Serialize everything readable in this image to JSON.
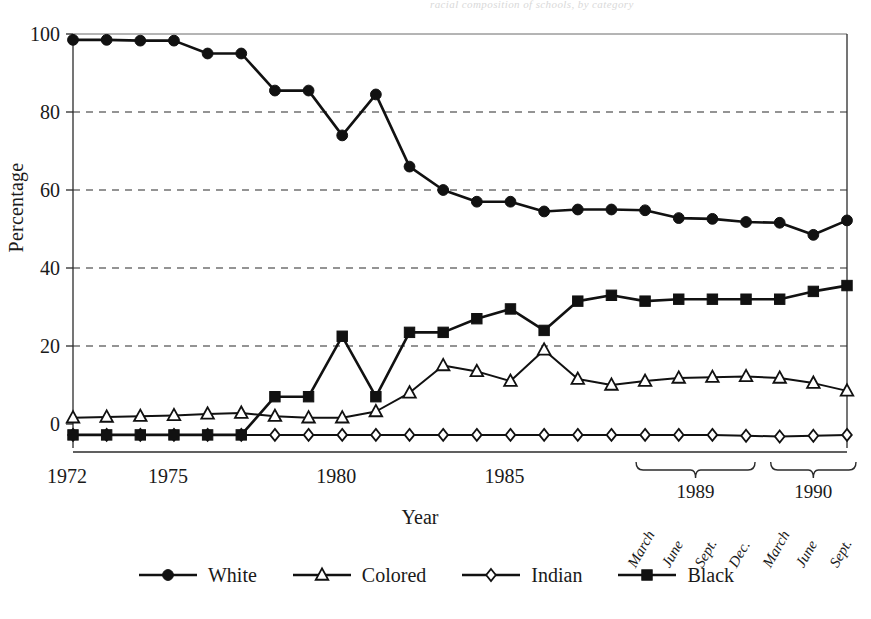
{
  "figure": {
    "bleed_text": "racial composition of schools, by category",
    "ylabel": "Percentage",
    "xlabel": "Year"
  },
  "axis": {
    "yticks": [
      "0",
      "20",
      "40",
      "60",
      "80",
      "100"
    ],
    "year_labels": [
      "1972",
      "1975",
      "1980",
      "1985"
    ],
    "bracket_years": [
      "1989",
      "1990"
    ],
    "months_1989": [
      "March",
      "June",
      "Sept.",
      "Dec."
    ],
    "months_1990": [
      "March",
      "June",
      "Sept."
    ]
  },
  "legend": {
    "items": [
      {
        "label": "White",
        "marker": "filled-circle-marker"
      },
      {
        "label": "Colored",
        "marker": "open-triangle-marker"
      },
      {
        "label": "Indian",
        "marker": "open-diamond-marker"
      },
      {
        "label": "Black",
        "marker": "filled-square-marker"
      }
    ]
  },
  "chart_data": {
    "type": "line",
    "title": "",
    "xlabel": "Year",
    "ylabel": "Percentage",
    "ylim": [
      -6,
      101
    ],
    "xlim": [
      0,
      26
    ],
    "grid": "horizontal-dashed",
    "legend_position": "bottom-center",
    "ytick_values": [
      0,
      20,
      40,
      60,
      80,
      100
    ],
    "categories": [
      "1972",
      "1973",
      "1974",
      "1975",
      "1976",
      "1977",
      "1978",
      "1979",
      "1980",
      "1981",
      "1982",
      "1983",
      "1984",
      "1985",
      "1986",
      "1987",
      "1988",
      "1989 March",
      "1989 June",
      "1989 Sept.",
      "1989 Dec.",
      "1990 March",
      "1990 June",
      "1990 Sept."
    ],
    "series": [
      {
        "name": "White",
        "marker": "filled-circle",
        "values": [
          98.5,
          98.5,
          98.3,
          98.3,
          95.0,
          95.0,
          85.5,
          85.5,
          74.0,
          84.5,
          66.0,
          60.0,
          57.0,
          57.0,
          54.5,
          55.0,
          55.0,
          54.8,
          52.8,
          52.6,
          51.8,
          51.6,
          48.5,
          52.2
        ]
      },
      {
        "name": "Colored",
        "marker": "open-triangle",
        "values": [
          1.6,
          1.8,
          2.0,
          2.2,
          2.6,
          2.8,
          2.0,
          1.6,
          1.6,
          3.2,
          8.0,
          15.0,
          13.5,
          11.0,
          19.0,
          11.5,
          10.0,
          11.0,
          11.8,
          12.0,
          12.2,
          11.8,
          10.5,
          8.5
        ]
      },
      {
        "name": "Indian",
        "marker": "open-diamond",
        "values": [
          -2.8,
          -2.8,
          -2.8,
          -2.8,
          -2.8,
          -2.8,
          -2.8,
          -2.8,
          -2.8,
          -2.8,
          -2.8,
          -2.8,
          -2.8,
          -2.8,
          -2.8,
          -2.8,
          -2.8,
          -2.8,
          -2.8,
          -2.8,
          -3.0,
          -3.2,
          -3.0,
          -2.8
        ]
      },
      {
        "name": "Black",
        "marker": "filled-square",
        "values": [
          -2.8,
          -2.8,
          -2.8,
          -2.8,
          -2.8,
          -2.8,
          7.0,
          7.0,
          22.5,
          7.0,
          23.5,
          23.5,
          27.0,
          29.5,
          24.0,
          31.5,
          33.0,
          31.5,
          32.0,
          32.0,
          32.0,
          32.0,
          34.0,
          35.5
        ]
      }
    ]
  }
}
